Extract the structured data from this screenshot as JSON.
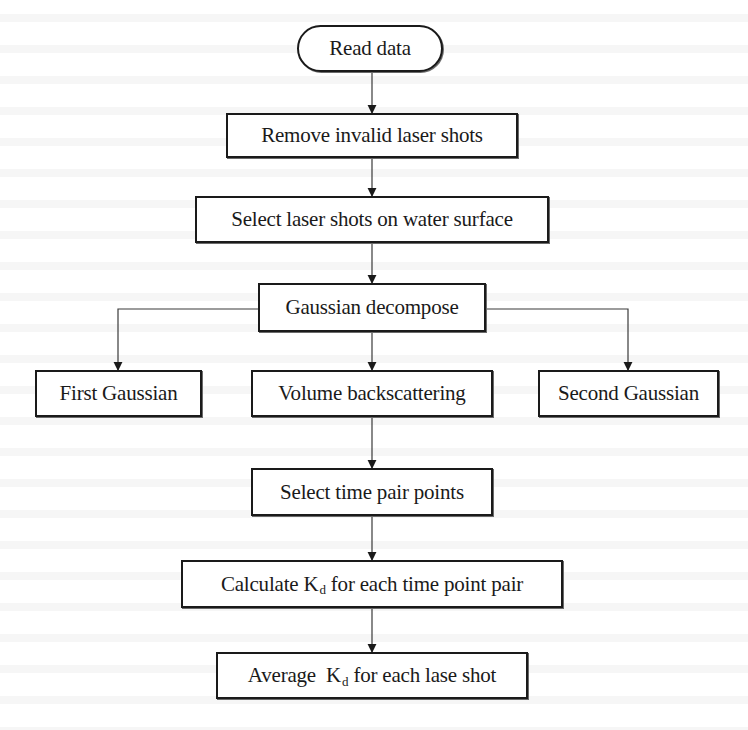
{
  "diagram": {
    "type": "flowchart",
    "nodes": {
      "read_data": {
        "label": "Read data",
        "shape": "terminal"
      },
      "remove_invalid": {
        "label": "Remove invalid laser shots",
        "shape": "process"
      },
      "select_water_surface": {
        "label": "Select laser shots on water surface",
        "shape": "process"
      },
      "gaussian_decompose": {
        "label": "Gaussian decompose",
        "shape": "process"
      },
      "first_gaussian": {
        "label": "First Gaussian",
        "shape": "process"
      },
      "volume_backscattering": {
        "label": "Volume backscattering",
        "shape": "process"
      },
      "second_gaussian": {
        "label": "Second Gaussian",
        "shape": "process"
      },
      "select_time_pair": {
        "label": "Select time pair points",
        "shape": "process"
      },
      "calculate_kd": {
        "label_pre": "Calculate K",
        "label_sub": "d",
        "label_post": " for each time point pair",
        "shape": "process"
      },
      "average_kd": {
        "label_pre": "Average  K",
        "label_sub": "d",
        "label_post": " for each lase shot",
        "shape": "process"
      }
    },
    "edges": [
      {
        "from": "read_data",
        "to": "remove_invalid"
      },
      {
        "from": "remove_invalid",
        "to": "select_water_surface"
      },
      {
        "from": "select_water_surface",
        "to": "gaussian_decompose"
      },
      {
        "from": "gaussian_decompose",
        "to": "first_gaussian"
      },
      {
        "from": "gaussian_decompose",
        "to": "volume_backscattering"
      },
      {
        "from": "gaussian_decompose",
        "to": "second_gaussian"
      },
      {
        "from": "volume_backscattering",
        "to": "select_time_pair"
      },
      {
        "from": "select_time_pair",
        "to": "calculate_kd"
      },
      {
        "from": "calculate_kd",
        "to": "average_kd"
      }
    ]
  }
}
